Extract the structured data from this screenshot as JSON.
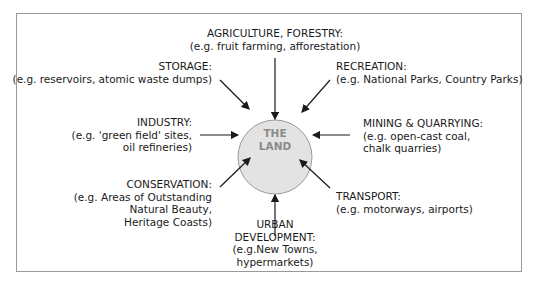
{
  "diagram": {
    "center": "THE\nLAND",
    "center_lines": [
      "THE",
      "LAND"
    ],
    "uses": [
      {
        "id": "agriculture",
        "title": "AGRICULTURE, FORESTRY:",
        "lines": [
          "(e.g. fruit farming, afforestation)"
        ]
      },
      {
        "id": "recreation",
        "title": "RECREATION:",
        "lines": [
          "(e.g. National Parks, Country Parks)"
        ]
      },
      {
        "id": "mining",
        "title": "MINING & QUARRYING:",
        "lines": [
          "(e.g. open-cast coal,",
          "chalk quarries)"
        ]
      },
      {
        "id": "transport",
        "title": "TRANSPORT:",
        "lines": [
          "(e.g. motorways, airports)"
        ]
      },
      {
        "id": "urban",
        "title": "URBAN\nDEVELOPMENT:",
        "title_lines": [
          "URBAN",
          "DEVELOPMENT:"
        ],
        "lines": [
          "(e.g.New Towns,",
          "hypermarkets)"
        ]
      },
      {
        "id": "conservation",
        "title": "CONSERVATION:",
        "lines": [
          "(e.g. Areas of Outstanding",
          "Natural Beauty,",
          "Heritage Coasts)"
        ]
      },
      {
        "id": "industry",
        "title": "INDUSTRY:",
        "lines": [
          "(e.g. 'green field' sites,",
          "oil refineries)"
        ]
      },
      {
        "id": "storage",
        "title": "STORAGE:",
        "lines": [
          "(e.g. reservoirs, atomic waste dumps)"
        ]
      }
    ],
    "colors": {
      "circle_fill": "#e3e3e3",
      "circle_stroke": "#9a9a9a",
      "center_text": "#8a8a8a",
      "arrow": "#1a1a1a",
      "frame": "#9a9a9a"
    }
  }
}
